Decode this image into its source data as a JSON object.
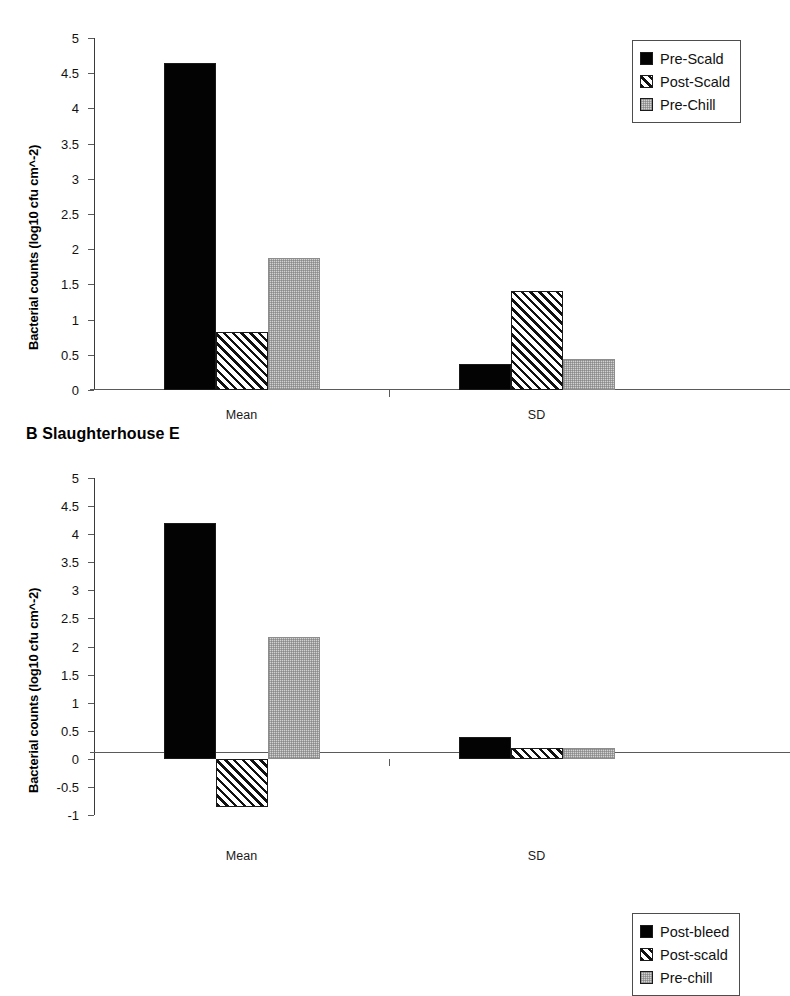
{
  "figure": {
    "ylabel": "Bacterial counts (log10 cfu cm^-2)",
    "categories": [
      "Mean",
      "SD"
    ]
  },
  "panel_a": {
    "title": "",
    "ylabel": "Bacterial counts (log10 cfu cm^-2)",
    "ytick_labels": [
      "5",
      "4.5",
      "4",
      "3.5",
      "3",
      "2.5",
      "2",
      "1.5",
      "1",
      "0.5",
      "0"
    ],
    "category_labels": [
      "Mean",
      "SD"
    ],
    "legend": [
      {
        "label": "Pre-Scald",
        "pattern": "solid"
      },
      {
        "label": "Post-Scald",
        "pattern": "hatch"
      },
      {
        "label": "Pre-Chill",
        "pattern": "dots"
      }
    ]
  },
  "panel_b": {
    "title": "B Slaughterhouse E",
    "ylabel": "Bacterial counts (log10 cfu cm^-2)",
    "ytick_labels": [
      "5",
      "4.5",
      "4",
      "3.5",
      "3",
      "2.5",
      "2",
      "1.5",
      "1",
      "0.5",
      "0",
      "-0.5",
      "-1"
    ],
    "category_labels": [
      "Mean",
      "SD"
    ],
    "legend": [
      {
        "label": "Post-bleed",
        "pattern": "solid"
      },
      {
        "label": "Post-scald",
        "pattern": "hatch"
      },
      {
        "label": "Pre-chill",
        "pattern": "dots"
      }
    ]
  },
  "chart_data": [
    {
      "type": "bar",
      "panel": "A",
      "title": "",
      "xlabel": "",
      "ylabel": "Bacterial counts (log10 cfu cm^-2)",
      "ylim": [
        0,
        5
      ],
      "ytick_step": 0.5,
      "grid": false,
      "legend_position": "top-right",
      "categories": [
        "Mean",
        "SD"
      ],
      "series": [
        {
          "name": "Pre-Scald",
          "values": [
            4.65,
            0.37
          ]
        },
        {
          "name": "Post-Scald",
          "values": [
            0.82,
            1.4
          ]
        },
        {
          "name": "Pre-Chill",
          "values": [
            1.87,
            0.44
          ]
        }
      ]
    },
    {
      "type": "bar",
      "panel": "B",
      "title": "B Slaughterhouse E",
      "xlabel": "",
      "ylabel": "Bacterial counts (log10 cfu cm^-2)",
      "ylim": [
        -1,
        5
      ],
      "ytick_step": 0.5,
      "grid": false,
      "legend_position": "top-right",
      "categories": [
        "Mean",
        "SD"
      ],
      "series": [
        {
          "name": "Post-bleed",
          "values": [
            4.2,
            0.38
          ]
        },
        {
          "name": "Post-scald",
          "values": [
            -0.85,
            0.2
          ]
        },
        {
          "name": "Pre-chill",
          "values": [
            2.17,
            0.19
          ]
        }
      ]
    }
  ]
}
